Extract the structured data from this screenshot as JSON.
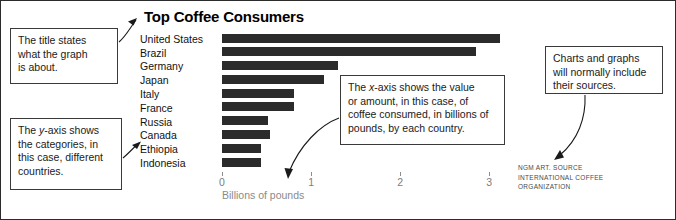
{
  "chart_data": {
    "type": "bar",
    "orientation": "horizontal",
    "title": "Top Coffee Consumers",
    "xlabel": "Billions of pounds",
    "ylabel": "",
    "grid": false,
    "legend": null,
    "xlim": [
      0,
      3.2
    ],
    "xticks": [
      0,
      1,
      2,
      3
    ],
    "xtick_labels": [
      "0",
      "1",
      "2",
      "3"
    ],
    "categories": [
      "United States",
      "Brazil",
      "Germany",
      "Japan",
      "Italy",
      "France",
      "Russia",
      "Canada",
      "Ethiopia",
      "Indonesia"
    ],
    "values": [
      3.0,
      2.75,
      1.25,
      1.1,
      0.78,
      0.78,
      0.5,
      0.52,
      0.42,
      0.42
    ],
    "source": "NGM ART. SOURCE INTERNATIONAL COFFEE ORGANIZATION"
  },
  "chart": {
    "title": "Top Coffee Consumers",
    "axis_title": "Billions of pounds"
  },
  "source_credit": {
    "line1": "NGM ART. SOURCE",
    "line2": "INTERNATIONAL COFFEE",
    "line3": "ORGANIZATION"
  },
  "callouts": {
    "title_note": {
      "line1": "The title states",
      "line2": "what the graph",
      "line3": "is about."
    },
    "yaxis_note": {
      "line1_a": "The ",
      "line1_em": "y",
      "line1_b": "-axis shows",
      "line2": "the categories, in",
      "line3": "this case, different",
      "line4": "countries."
    },
    "xaxis_note": {
      "line1_a": "The ",
      "line1_em": "x",
      "line1_b": "-axis shows the value",
      "line2": "or amount, in this case, of",
      "line3": "coffee consumed, in billions of",
      "line4": "pounds, by each country."
    },
    "source_note": {
      "line1": "Charts and graphs",
      "line2": "will normally include",
      "line3": "their sources."
    }
  },
  "colors": {
    "bar": "#2b2b2b",
    "axis_text": "#7d7d7d",
    "frame": "#2b2b2b",
    "callout_border": "#3a3a3a"
  }
}
